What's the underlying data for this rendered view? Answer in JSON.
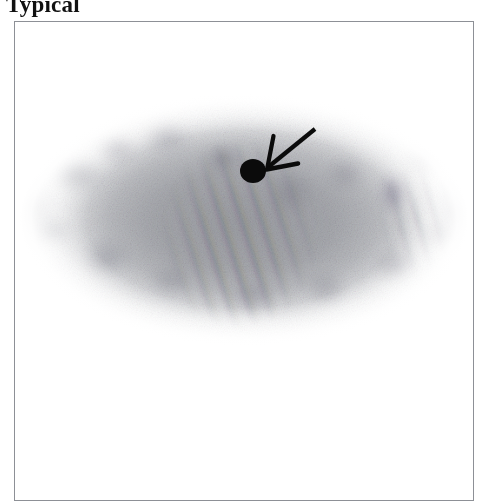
{
  "figure": {
    "title": "Typical",
    "panel_border_color": "#8d9096",
    "background_color": "#ffffff"
  },
  "scan": {
    "name": "grayscale-oval-scan",
    "modality_appearance": "grayscale mottled oval body cross-section with diagonal moire striping",
    "dominant_tone": "#9a9ca2",
    "stripe_tint_purple": "#927896",
    "stripe_tint_teal": "#687e8c"
  },
  "annotations": {
    "marker_dot": {
      "name": "black-marker-dot",
      "color": "#0b0b0b",
      "center_x": 238,
      "center_y": 149,
      "radius_x": 13,
      "radius_y": 12
    },
    "arrow": {
      "name": "pointer-arrow",
      "color": "#0b0b0b",
      "tail_x": 300,
      "tail_y": 107,
      "tip_x": 252,
      "tip_y": 146,
      "direction": "down-left"
    }
  }
}
